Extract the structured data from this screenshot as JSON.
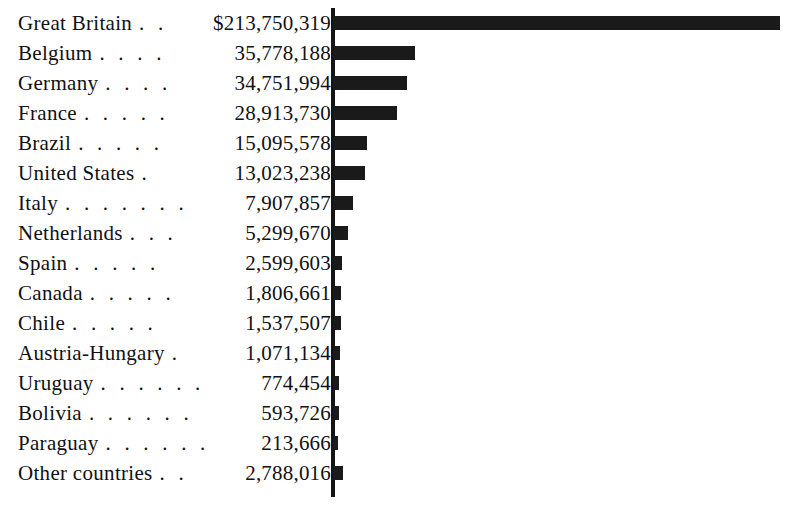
{
  "chart_data": {
    "type": "bar",
    "title": "",
    "subtitle": "",
    "xlabel": "",
    "ylabel": "",
    "orientation": "horizontal",
    "grid": false,
    "legend": null,
    "currency_symbol": "$",
    "axis_origin_x": 333,
    "xlim": [
      0,
      213750319
    ],
    "categories": [
      "Great Britain",
      "Belgium",
      "Germany",
      "France",
      "Brazil",
      "United States",
      "Italy",
      "Netherlands",
      "Spain",
      "Canada",
      "Chile",
      "Austria-Hungary",
      "Uruguay",
      "Bolivia",
      "Paraguay",
      "Other countries"
    ],
    "values": [
      213750319,
      35778188,
      34751994,
      28913730,
      15095578,
      13023238,
      7907857,
      5299670,
      2599603,
      1806661,
      1537507,
      1071134,
      774454,
      593726,
      213666,
      2788016
    ],
    "value_labels": [
      "$213,750,319",
      "35,778,188",
      "34,751,994",
      "28,913,730",
      "15,095,578",
      "13,023,238",
      "7,907,857",
      "5,299,670",
      "2,599,603",
      "1,806,661",
      "1,537,507",
      "1,071,134",
      "774,454",
      "593,726",
      "213,666",
      "2,788,016"
    ],
    "leaders": [
      ". .",
      ". . . .",
      ". . . .",
      ". . . . .",
      ". . . . .",
      ".",
      ". . . . . . .",
      ". . .",
      ". . . . .",
      ". . . . .",
      ". . . . .",
      ".",
      ". . . . . .",
      ". . . . . .",
      ". . . . . .",
      ". ."
    ],
    "bar_pixel_widths": [
      447,
      82,
      74,
      64,
      34,
      32,
      20,
      15,
      9,
      8,
      8,
      7,
      6,
      6,
      5,
      10
    ],
    "colors": {
      "bar": "#1a1a1a",
      "axis": "#141414",
      "text": "#111111",
      "background": "#ffffff"
    }
  }
}
